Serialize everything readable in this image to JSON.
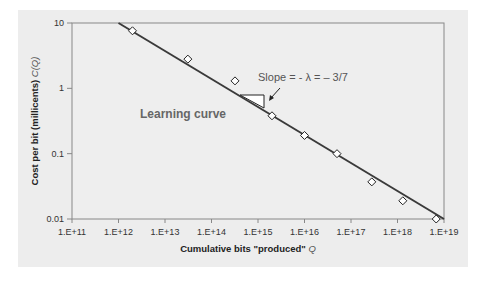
{
  "chart_data": {
    "type": "scatter",
    "title": "",
    "xlabel": "Cumulative bits \"produced\" Q",
    "ylabel": "Cost per bit (millicents) C(Q)",
    "xscale": "log",
    "yscale": "log",
    "xlim": [
      100000000000.0,
      1e+19
    ],
    "ylim": [
      0.01,
      10
    ],
    "x_tick_labels": [
      "1.E+11",
      "1.E+12",
      "1.E+13",
      "1.E+14",
      "1.E+15",
      "1.E+16",
      "1.E+17",
      "1.E+18",
      "1.E+19"
    ],
    "y_tick_labels": [
      "10",
      "1",
      "0.1",
      "0.01"
    ],
    "grid": false,
    "series": [
      {
        "name": "data",
        "marker": "diamond-open",
        "x": [
          2000000000000.0,
          31000000000000.0,
          320000000000000.0,
          2000000000000000.0,
          1e+16,
          5e+16,
          2.8e+17,
          1.3e+18,
          6.8e+18
        ],
        "y": [
          7.6,
          2.8,
          1.3,
          0.38,
          0.19,
          0.1,
          0.037,
          0.019,
          0.01
        ]
      },
      {
        "name": "Learning curve fit",
        "type": "line",
        "x": [
          1000000000000.0,
          1e+19
        ],
        "y": [
          10,
          0.01
        ]
      }
    ],
    "annotations": [
      {
        "text": "Slope = - λ = – 3/7",
        "arrow": true
      },
      {
        "text": "Learning curve"
      }
    ]
  },
  "labels": {
    "x_title_main": "Cumulative bits \"produced\" ",
    "x_title_var": "Q",
    "y_title_main": "Cost per bit (millicents) ",
    "y_title_var": "C(Q)",
    "slope_text": "Slope = - λ = – 3/7",
    "curve_text": "Learning curve",
    "x_ticks": [
      "1.E+11",
      "1.E+12",
      "1.E+13",
      "1.E+14",
      "1.E+15",
      "1.E+16",
      "1.E+17",
      "1.E+18",
      "1.E+19"
    ],
    "y_ticks": [
      "10",
      "1",
      "0.1",
      "0.01"
    ]
  }
}
